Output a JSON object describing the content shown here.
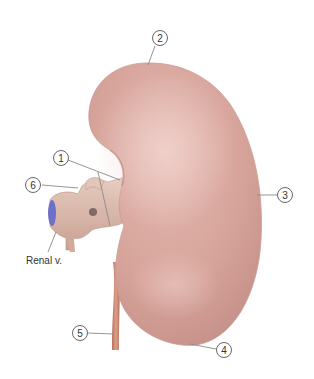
{
  "figure": {
    "colors": {
      "kidney_base": "#d9a79e",
      "kidney_highlight": "#ecc9c2",
      "kidney_shadow": "#c08b84",
      "vessel": "#d8b3a6",
      "vein_cut": "#6b6fc4",
      "ureter": "#c98368",
      "leader_line": "#888888",
      "callout_stroke": "#555555"
    },
    "callouts": [
      {
        "number": "1"
      },
      {
        "number": "2"
      },
      {
        "number": "3"
      },
      {
        "number": "4"
      },
      {
        "number": "5"
      },
      {
        "number": "6"
      }
    ],
    "labels": {
      "renal_vein": "Renal v."
    }
  }
}
